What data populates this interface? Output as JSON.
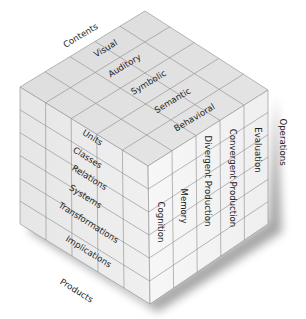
{
  "axes": {
    "contents": {
      "label": "Contents",
      "items": [
        "Visual",
        "Auditory",
        "Symbolic",
        "Semantic",
        "Behavioral"
      ]
    },
    "products": {
      "label": "Products",
      "items": [
        "Units",
        "Classes",
        "Relations",
        "Systems",
        "Transformations",
        "Implications"
      ]
    },
    "operations": {
      "label": "Operations",
      "items": [
        "Cognition",
        "Memory",
        "Divergent Production",
        "Convergent Production",
        "Evaluation"
      ]
    }
  },
  "colors": {
    "top_face": "#e2e2e2",
    "left_face": "#ececec",
    "right_face": "#f4f4f4",
    "grid_line": "#8a8a8a",
    "text": "#222222"
  }
}
